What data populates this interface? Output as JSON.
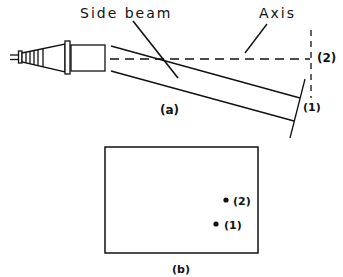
{
  "figure": {
    "part_a": {
      "caption": "(a)",
      "labels": {
        "side_beam": "Side beam",
        "axis": "Axis",
        "point_2": "(2)",
        "point_1": "(1)"
      }
    },
    "part_b": {
      "caption": "(b)",
      "spots": [
        {
          "label": "(2)"
        },
        {
          "label": "(1)"
        }
      ]
    }
  },
  "colors": {
    "ink": "#111111",
    "background": "#ffffff"
  }
}
